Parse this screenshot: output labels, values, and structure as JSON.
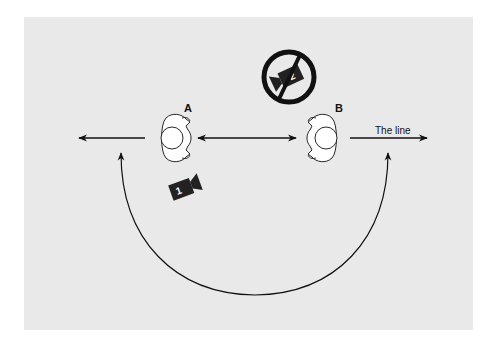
{
  "diagram": {
    "characters": [
      {
        "id": "A",
        "label": "A"
      },
      {
        "id": "B",
        "label": "B"
      }
    ],
    "line_label": "The line",
    "cameras": [
      {
        "id": "camera-1",
        "number": "1",
        "status": "allowed"
      },
      {
        "id": "camera-2",
        "number": "2",
        "status": "prohibited"
      }
    ],
    "colors": {
      "background": "#e9e9e9",
      "ink": "#111111",
      "figure_fill": "#ffffff",
      "camera_fill": "#222222"
    }
  }
}
